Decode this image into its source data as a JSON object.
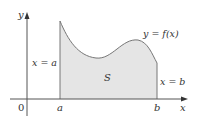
{
  "figure": {
    "labels": {
      "y_axis": "y",
      "x_axis": "x",
      "origin": "0",
      "a_tick": "a",
      "b_tick": "b",
      "left_bound": "x = a",
      "right_bound": "x = b",
      "curve": "y = f(x)",
      "region": "S"
    },
    "colors": {
      "fill": "#e5e5e5",
      "curve": "#777777",
      "axes": "#555555",
      "text": "#333333"
    }
  }
}
